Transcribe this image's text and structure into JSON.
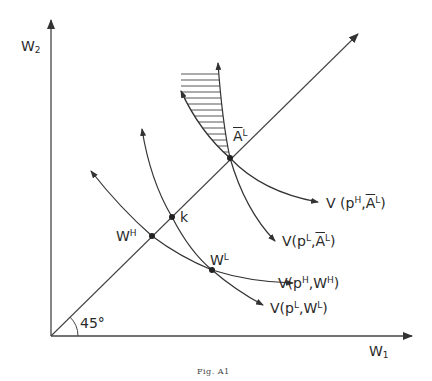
{
  "figure": {
    "caption": "Fig. A1",
    "y_axis_label": "W",
    "y_axis_sub": "2",
    "x_axis_label": "W",
    "x_axis_sub": "1",
    "angle_label": "45°"
  },
  "points": {
    "a_bar_l": {
      "base": "A",
      "sup": "L"
    },
    "k": {
      "base": "k"
    },
    "w_h": {
      "base": "W",
      "sup": "H"
    },
    "w_l": {
      "base": "W",
      "sup": "L"
    }
  },
  "curves": {
    "v_ph_al": {
      "prefix": "V (p",
      "sup1": "H",
      "mid": ",",
      "base2": "A",
      "sup2": "L",
      "suffix": ")"
    },
    "v_pl_al": {
      "prefix": "V(p",
      "sup1": "L",
      "mid": ",",
      "base2": "A",
      "sup2": "L",
      "suffix": ")"
    },
    "v_ph_wh": {
      "prefix": "V(p",
      "sup1": "H",
      "mid": ",W",
      "sup2": "H",
      "suffix": ")"
    },
    "v_pl_wl": {
      "prefix": "V(p",
      "sup1": "L",
      "mid": ",W",
      "sup2": "L",
      "suffix": ")"
    }
  }
}
